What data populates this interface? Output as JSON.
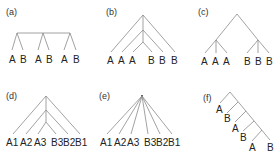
{
  "figure": {
    "panels": [
      {
        "id": "a",
        "label": "(a)",
        "leaves": [
          "A",
          "B",
          "A",
          "B",
          "A",
          "B"
        ],
        "structure": "three cherries joined by a horizontal bar"
      },
      {
        "id": "b",
        "label": "(b)",
        "leaves": [
          "A",
          "A",
          "A",
          "B",
          "B",
          "B"
        ],
        "structure": "nested symmetric (A(A(A,B)B)B)"
      },
      {
        "id": "c",
        "label": "(c)",
        "leaves": [
          "A",
          "A",
          "A",
          "B",
          "B",
          "B"
        ],
        "structure": "two trifurcating clades"
      },
      {
        "id": "d",
        "label": "(d)",
        "leaves": [
          "A1",
          "A2",
          "A3",
          "B3",
          "B2",
          "B1"
        ],
        "structure": "nested symmetric pairs"
      },
      {
        "id": "e",
        "label": "(e)",
        "leaves": [
          "A1",
          "A2",
          "A3",
          "B3",
          "B2",
          "B1"
        ],
        "structure": "star polytomy"
      },
      {
        "id": "f",
        "label": "(f)",
        "leaves": [
          "A",
          "B",
          "A",
          "B",
          "A",
          "B"
        ],
        "structure": "caterpillar (ladder) tree"
      }
    ]
  },
  "colors": {
    "edge": "#8a8a8a",
    "text": "#222222",
    "background": "#ffffff"
  }
}
